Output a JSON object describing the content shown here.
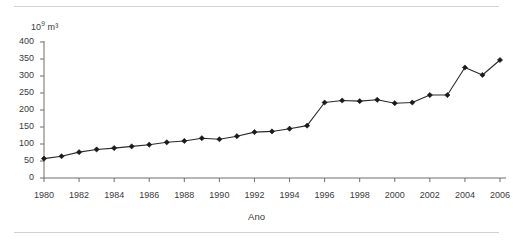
{
  "chart_data": {
    "type": "line",
    "title": "",
    "xlabel": "Ano",
    "ylabel": "10⁹ m³",
    "ylabel_base": "10",
    "ylabel_exp": "9",
    "ylabel_unit": " m³",
    "xlim": [
      1980,
      2006
    ],
    "ylim": [
      0,
      400
    ],
    "ytick_step": 50,
    "xtick_step": 2,
    "grid": false,
    "legend": null,
    "marker": "diamond",
    "line_color": "#2b2b2b",
    "marker_color": "#1a1a1a",
    "axis_color": "#6e6e6e",
    "rule_color": "#d2d2d2",
    "yticks": [
      0,
      50,
      100,
      150,
      200,
      250,
      300,
      350,
      400
    ],
    "xticks": [
      1980,
      1982,
      1984,
      1986,
      1988,
      1990,
      1992,
      1994,
      1996,
      1998,
      2000,
      2002,
      2004,
      2006
    ],
    "x": [
      1980,
      1981,
      1982,
      1983,
      1984,
      1985,
      1986,
      1987,
      1988,
      1989,
      1990,
      1991,
      1992,
      1993,
      1994,
      1995,
      1996,
      1997,
      1998,
      1999,
      2000,
      2001,
      2002,
      2003,
      2004,
      2005,
      2006
    ],
    "values": [
      57,
      64,
      76,
      84,
      88,
      93,
      98,
      105,
      109,
      117,
      114,
      123,
      135,
      137,
      145,
      154,
      222,
      228,
      226,
      230,
      220,
      222,
      244,
      244,
      325,
      303,
      347
    ],
    "series": [
      {
        "name": "",
        "values": [
          57,
          64,
          76,
          84,
          88,
          93,
          98,
          105,
          109,
          117,
          114,
          123,
          135,
          137,
          145,
          154,
          222,
          228,
          226,
          230,
          220,
          222,
          244,
          244,
          325,
          303,
          347
        ]
      }
    ]
  }
}
